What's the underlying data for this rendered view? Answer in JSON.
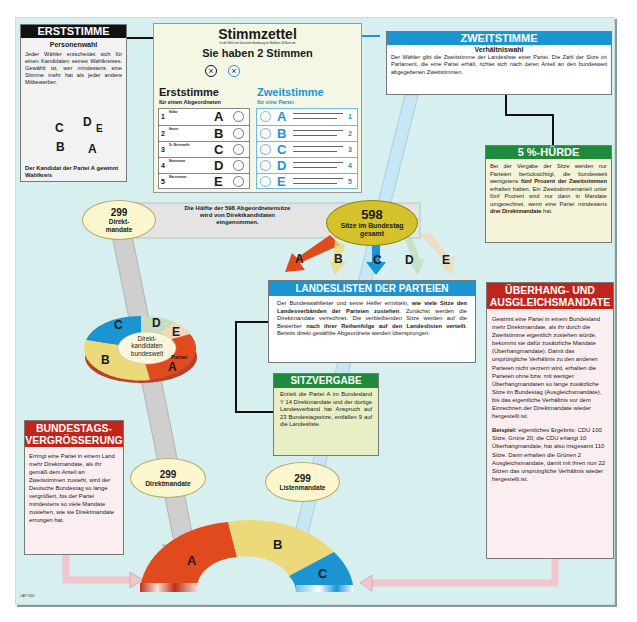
{
  "ballot": {
    "title": "Stimmzettel",
    "subtitle": "für die Wahl zum Deutschen Bundestag im Wahlkreis 43 Bonn am",
    "headline": "Sie haben 2 Stimmen",
    "erst": {
      "title": "Erststimme",
      "sub": "für einen Abgeordneten",
      "rows": [
        {
          "num": "1",
          "name": "Kalbar",
          "letter": "A"
        },
        {
          "num": "2",
          "name": "Hauser",
          "letter": "B"
        },
        {
          "num": "3",
          "name": "Dr. Westerwelle",
          "letter": "C"
        },
        {
          "num": "4",
          "name": "Mannemann",
          "letter": "D"
        },
        {
          "num": "5",
          "name": "Wassermann",
          "letter": "E"
        }
      ]
    },
    "zweit": {
      "title": "Zweitstimme",
      "sub": "für eine Partei",
      "rows": [
        {
          "num": "1",
          "letter": "A"
        },
        {
          "num": "2",
          "letter": "B"
        },
        {
          "num": "3",
          "letter": "C"
        },
        {
          "num": "4",
          "letter": "D"
        },
        {
          "num": "5",
          "letter": "E"
        }
      ]
    },
    "mark": "×"
  },
  "erststimme": {
    "header": "ERSTSTIMME",
    "subheader": "Personenwahl",
    "text": "Jeder Wähler entscheidet sich für einen Kandidaten seines Wahlkreises. Gewählt ist, wer mindestens eine Stimme mehr hat als jeder andere Mitbewerber.",
    "pie_labels": [
      "C",
      "D",
      "E",
      "B",
      "A"
    ],
    "caption": "Der Kandidat der Partei A gewinnt Wahlkreis"
  },
  "zweitstimme": {
    "header": "ZWEITSTIMME",
    "subheader": "Verhältniswahl",
    "text": "Der Wähler gibt die Zweitstimme der Landesliste einer Partei. Die Zahl der Sitze im Parlament, die eine Partei erhält, richtet sich nach deren Anteil an den bundesweit abgegebenen Zweitstimmen."
  },
  "huerde": {
    "header": "5 %-HÜRDE",
    "text_parts": [
      "Bei der Vergabe der Sitze werden nur Parteien berücksichtigt, die bundesweit wenigstens ",
      "fünf Prozent der Zweitstimmen",
      " erhalten haben. Ein Zweitstimmenanteil unter fünf Prozent wird nur dann in Mandate umgerechnet, wenn eine Partei mindestens ",
      "drei Direktmandate",
      " hat."
    ]
  },
  "direkt_top": {
    "num": "299",
    "label": "Direkt-mandate",
    "band_text": "Die Hälfte der 598 Abgeordnetensitze wird von Direktkandidaten eingenommen."
  },
  "total": {
    "num": "598",
    "label": "Sitze im Bundestag gesamt"
  },
  "party_arrows": [
    "A",
    "B",
    "C",
    "D",
    "E"
  ],
  "landeslisten": {
    "header": "LANDESLISTEN DER PARTEIEN",
    "text_parts": [
      "Der Bundeswahlleiter und seine Helfer ermitteln, ",
      "wie viele Sitze den Landesverbänden der Parteien zustehen",
      ". Zunächst werden die Direktmandate verrechnet. Die verbleibenden Sitze werden auf die Bewerber ",
      "nach ihrer Reihenfolge auf den Landeslisten verteilt",
      ". Bereits direkt gewählte Abgeordnete werden übersprungen."
    ]
  },
  "sitzvergabe": {
    "header": "SITZVERGABE",
    "text": "Erzielt die Partei A im Bundesland Y 14 Direktmandate und der dortige Landesverband hat Anspruch auf 23 Bundestagssitze, entfallen 9 auf die Landesliste."
  },
  "direkt_pie": {
    "center": "Direkt-kandidaten bundesweit",
    "labels": [
      "C",
      "D",
      "E",
      "B",
      "A"
    ],
    "partei": "Partei"
  },
  "ueberhang": {
    "header_line1": "ÜBERHANG- UND",
    "header_line2": "AUSGLEICHSMANDATE",
    "text": "Gewinnt eine Partei in einem Bundesland mehr Direktmandate, als ihr durch die Zweitstimme eigentlich zustehen würde, bekommt sie dafür zusätzliche Mandate (Überhangmandate). Damit das ursprüngliche Verhältnis zu den anderen Parteien nicht verzerrt wird, erhalten die Parteien ohne bzw. mit weniger Überhangmandaten so lange zusätzliche Sitze im Bundestag (Ausgleichsmandate), bis das eigentliche Verhältnis vor dem Einrechnen der Direktmandate wieder hergestellt ist.",
    "example_label": "Beispiel:",
    "example_text": " eigentliches Ergebnis: CDU 100 Sitze, Grüne 20; die CDU erlangt 10 Überhangmandate, hat also insgesamt 110 Sitze. Dann erhalten die Grünen 2 Ausgleichsmandate, damit mit ihren nun 22 Sitzen das ursprüngliche Verhältnis wieder hergestellt ist."
  },
  "vergroesserung": {
    "header_line1": "BUNDESTAGS-",
    "header_line2": "VERGRÖSSERUNG",
    "text": "Erringt eine Partei in einem Land mehr Direktmandate, als ihr gemäß dem Anteil an Zweitstimmen zusteht, wird der Deutsche Bundestag so lange vergrößert, bis der Partei mindestens so viele Mandate zustehen, wie sie Direktmandate errungen hat."
  },
  "direkt_bottom": {
    "num": "299",
    "label": "Direktmandate"
  },
  "listen_bottom": {
    "num": "299",
    "label": "Listenmandate"
  },
  "parliament": {
    "labels": [
      "A",
      "B",
      "C"
    ]
  },
  "credit": "LAP/ 666",
  "colors": {
    "A": "#e04a1c",
    "B": "#ecd97a",
    "C": "#1b95d2",
    "D": "#c7dcc1",
    "E": "#f0d9bb",
    "background": "#d7efee",
    "blue": "#1b95d2",
    "green": "#1f8a3b",
    "red": "#c1241b"
  }
}
